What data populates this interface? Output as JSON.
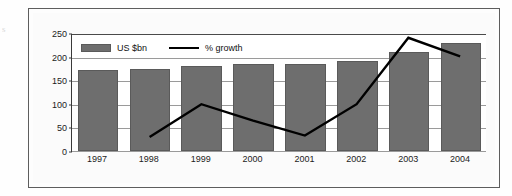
{
  "figure": {
    "margin_mark": "s"
  },
  "legend": {
    "position": "top-left-inside",
    "entries": [
      {
        "label": "US $bn",
        "type": "bar",
        "color": "#6e6e6e",
        "icon": "bar-swatch-icon"
      },
      {
        "label": "% growth",
        "type": "line",
        "color": "#000000",
        "icon": "line-swatch-icon"
      }
    ]
  },
  "chart_data": {
    "type": "bar",
    "title": "",
    "subtitle": "",
    "xlabel": "",
    "ylabel": "",
    "categories": [
      "1997",
      "1998",
      "1999",
      "2000",
      "2001",
      "2002",
      "2003",
      "2004"
    ],
    "ylim": [
      0,
      250
    ],
    "yticks": [
      0,
      50,
      100,
      150,
      200,
      250
    ],
    "ytick_labels": [
      "0",
      "50",
      "100",
      "150",
      "200",
      "250"
    ],
    "grid": true,
    "legend_position": "top-left-inside",
    "series": [
      {
        "name": "US $bn",
        "type": "bar",
        "color": "#6e6e6e",
        "values": [
          172,
          173,
          181,
          184,
          184,
          190,
          210,
          229
        ]
      },
      {
        "name": "% growth",
        "type": "line",
        "color": "#000000",
        "values": [
          null,
          30,
          100,
          65,
          33,
          100,
          242,
          202
        ]
      }
    ]
  }
}
